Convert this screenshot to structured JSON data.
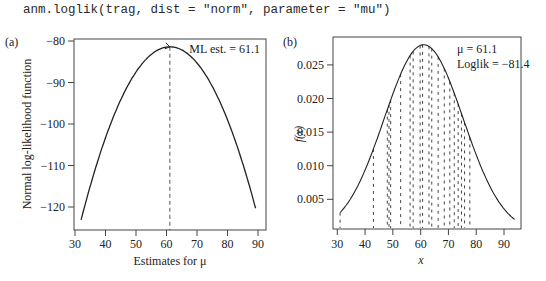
{
  "code_line": "anm.loglik(trag, dist = \"norm\", parameter = \"mu\")",
  "colors": {
    "line": "#222222",
    "axis": "#444444",
    "background": "#ffffff"
  },
  "chart_data": [
    {
      "panel_label": "(a)",
      "type": "line",
      "title": "",
      "xlabel": "Estimates for μ",
      "ylabel": "Normal log-likelihood function",
      "xlim": [
        30,
        92
      ],
      "ylim": [
        -125,
        -79.5
      ],
      "xticks": [
        30,
        40,
        50,
        60,
        70,
        80,
        90
      ],
      "yticks": [
        -80,
        -90,
        -100,
        -110,
        -120
      ],
      "ytick_labels": [
        "−80",
        "−90",
        "−100",
        "−110",
        "−120"
      ],
      "annotation": "ML est. = 61.1",
      "ml_estimate": 61.1,
      "max_loglik": -81.4,
      "curve": {
        "description": "quadratic log-likelihood of normal mean, n = 20, sigma = 14.25",
        "x": [
          32,
          35,
          40,
          45,
          50,
          55,
          61.1,
          65,
          70,
          75,
          80,
          85,
          89.6
        ],
        "y": [
          -123.1,
          -114.9,
          -103.3,
          -94.2,
          -87.5,
          -83.2,
          -81.4,
          -82.1,
          -83.4,
          -87.4,
          -99.0,
          -109.6,
          -121.4
        ]
      },
      "vline_x": 61.1,
      "grid": false
    },
    {
      "panel_label": "(b)",
      "type": "line",
      "title": "",
      "xlabel": "x",
      "ylabel": "f(x)",
      "xlim": [
        28.5,
        96
      ],
      "ylim": [
        -0.001,
        0.0295
      ],
      "xticks": [
        30,
        40,
        50,
        60,
        70,
        80,
        90
      ],
      "yticks": [
        0.005,
        0.01,
        0.015,
        0.02,
        0.025
      ],
      "ytick_labels": [
        "0.005",
        "0.010",
        "0.015",
        "0.020",
        "0.025"
      ],
      "annotations": [
        "μ = 61.1",
        "Loglik = −81.4"
      ],
      "density": {
        "dist": "norm",
        "mean": 61.1,
        "sd": 14.25,
        "x_from": 31,
        "x_to": 94
      },
      "observations": [
        31,
        43,
        48,
        48.6,
        49.2,
        52.8,
        56.2,
        57.3,
        59.8,
        60.7,
        63.0,
        64.0,
        66.3,
        68.5,
        70.5,
        72.1,
        73.5,
        74.7,
        75.8,
        77.7
      ],
      "grid": false
    }
  ]
}
